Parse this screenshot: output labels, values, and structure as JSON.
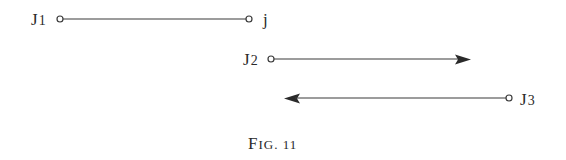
{
  "figure": {
    "caption": "Fig. 11",
    "caption_display": "FIG. 11",
    "stroke_color": "#3a3a3a",
    "elements": [
      {
        "id": "line-1",
        "from_label": "J1",
        "to_label": "j",
        "type": "segment",
        "x1": 60,
        "x2": 249,
        "y": 19,
        "start": "open-circle",
        "end": "open-circle"
      },
      {
        "id": "line-2",
        "from_label": "J2",
        "type": "arrow-right",
        "x1": 271,
        "x2": 471,
        "y": 59,
        "start": "open-circle",
        "end": "arrowhead"
      },
      {
        "id": "line-3",
        "from_label": "J3",
        "type": "arrow-left",
        "x1": 509,
        "x2": 285,
        "y": 98,
        "start": "open-circle",
        "end": "arrowhead"
      }
    ],
    "labels": {
      "j1": "J",
      "j1_sub": "1",
      "j": "j",
      "j2": "J",
      "j2_sub": "2",
      "j3": "J",
      "j3_sub": "3"
    }
  }
}
